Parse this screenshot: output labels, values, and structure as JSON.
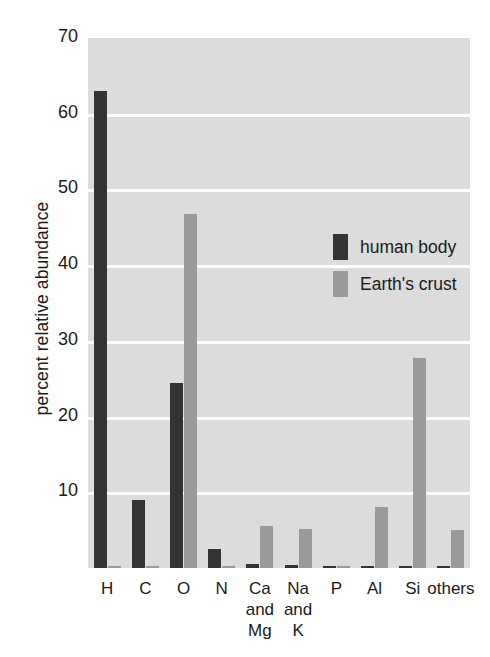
{
  "chart_data": {
    "type": "bar",
    "title": "",
    "subtitle": "",
    "xlabel": "",
    "ylabel": "percent relative abundance",
    "ylim": [
      0,
      70
    ],
    "ytick_labels": [
      "70",
      "60",
      "50",
      "40",
      "30",
      "20",
      "10"
    ],
    "ytick_values": [
      70,
      60,
      50,
      40,
      30,
      20,
      10
    ],
    "grid": true,
    "grid_color": "#ffffff",
    "plot_background": "#dcdcdc",
    "legend_position": "inside-upper-right",
    "categories": [
      "H",
      "C",
      "O",
      "N",
      "Ca\nand\nMg",
      "Na\nand\nK",
      "P",
      "Al",
      "Si",
      "others"
    ],
    "category_lines": [
      [
        "H"
      ],
      [
        "C"
      ],
      [
        "O"
      ],
      [
        "N"
      ],
      [
        "Ca",
        "and",
        "Mg"
      ],
      [
        "Na",
        "and",
        "K"
      ],
      [
        "P"
      ],
      [
        "Al"
      ],
      [
        "Si"
      ],
      [
        "others"
      ]
    ],
    "series": [
      {
        "name": "human body",
        "color": "#333333",
        "values": [
          63.0,
          9.0,
          24.5,
          2.5,
          0.5,
          0.4,
          0.3,
          0.0,
          0.0,
          0.0
        ]
      },
      {
        "name": "Earth's crust",
        "color": "#9a9a9a",
        "values": [
          0.3,
          0.2,
          46.7,
          0.2,
          5.5,
          5.2,
          0.2,
          8.1,
          27.7,
          5.0
        ]
      }
    ]
  },
  "legend": {
    "entries": [
      {
        "label": "human body",
        "color": "#333333"
      },
      {
        "label": "Earth's crust",
        "color": "#9a9a9a"
      }
    ]
  }
}
